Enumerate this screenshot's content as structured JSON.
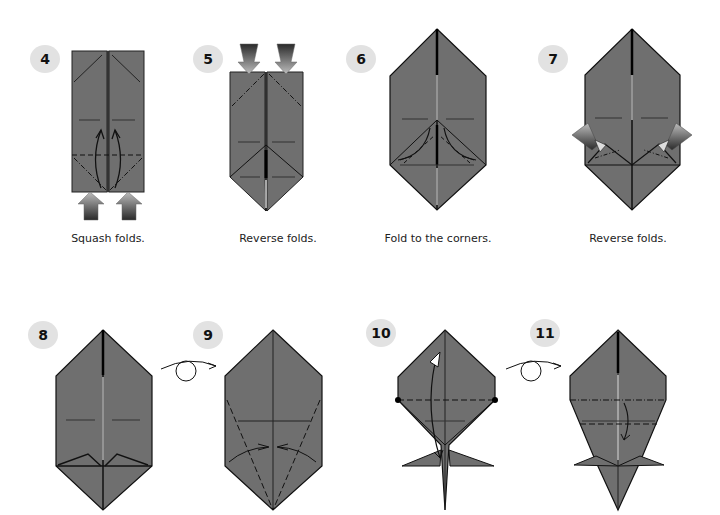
{
  "diagram": {
    "paper_color": "#6f6f6f",
    "line_color": "#111111",
    "badge_color": "#e2e2e2",
    "steps": [
      {
        "number": "4",
        "caption": "Squash folds."
      },
      {
        "number": "5",
        "caption": "Reverse folds."
      },
      {
        "number": "6",
        "caption": "Fold to the corners."
      },
      {
        "number": "7",
        "caption": "Reverse folds."
      },
      {
        "number": "8",
        "caption": ""
      },
      {
        "number": "9",
        "caption": ""
      },
      {
        "number": "10",
        "caption": ""
      },
      {
        "number": "11",
        "caption": ""
      }
    ],
    "turn_over_symbols": [
      {
        "between": [
          "8",
          "9"
        ],
        "icon": "turn-over-icon"
      },
      {
        "between": [
          "10",
          "11"
        ],
        "icon": "turn-over-icon"
      }
    ]
  }
}
